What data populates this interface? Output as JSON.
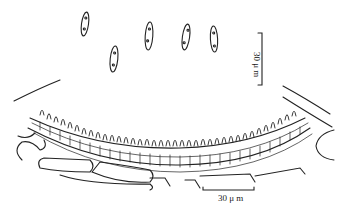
{
  "figure": {
    "scale_bars": {
      "conidia": {
        "label": "30 μ m",
        "orientation": "vertical"
      },
      "conidioma": {
        "label": "30 μ m",
        "orientation": "horizontal"
      }
    },
    "conidia_count": 5,
    "colors": {
      "ink": "#222222",
      "background": "#ffffff"
    }
  }
}
